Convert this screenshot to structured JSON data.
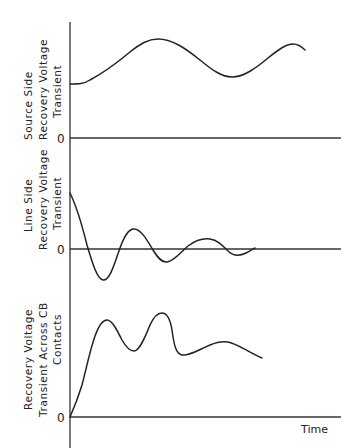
{
  "diagram": {
    "title": "",
    "x_axis_label": "Time",
    "panels": [
      {
        "id": "source-side",
        "ylabel_lines": [
          "Source   Side",
          "Recovery   Voltage",
          "Transient"
        ],
        "zero_label": "0",
        "description": "Slow, low-frequency oscillation about a positive level (source side recovery voltage)"
      },
      {
        "id": "line-side",
        "ylabel_lines": [
          "Line  Side",
          "Recovery  Voltage",
          "Transient"
        ],
        "zero_label": "0",
        "description": "Damped oscillation starting positive, swinging about zero and decaying"
      },
      {
        "id": "across-cb",
        "ylabel_lines": [
          "Recovery   Voltage",
          "Transient  Across  CB",
          "Contacts"
        ],
        "zero_label": "0",
        "description": "Sum of source and line transients: rises from zero with multiple peaks"
      }
    ],
    "colors": {
      "ink": "#222222",
      "background": "#ffffff"
    }
  }
}
